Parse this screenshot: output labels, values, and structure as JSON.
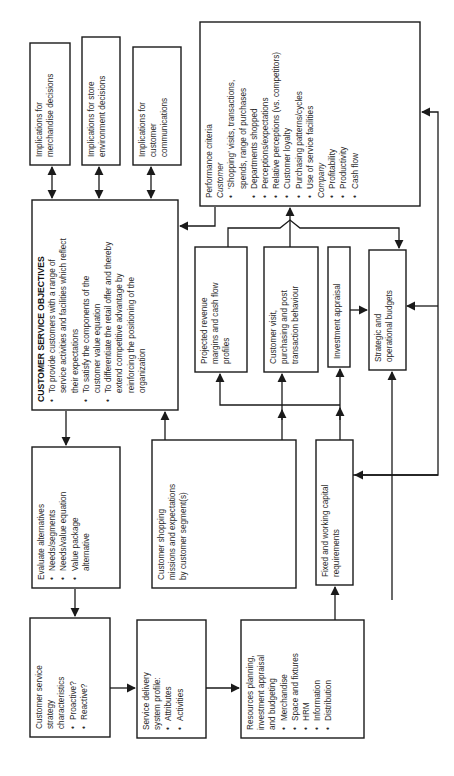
{
  "diagram": {
    "implications": [
      {
        "lines": [
          "Implications for",
          "merchandise decisions"
        ]
      },
      {
        "lines": [
          "Implications for store",
          "environment decisions"
        ]
      },
      {
        "lines": [
          "Implications for",
          "customer",
          "communications"
        ]
      }
    ],
    "objectives": {
      "title": "CUSTOMER SERVICE OBJECTIVES",
      "bullets": [
        [
          "To provide customers with a range of",
          "service activities and facilities which reflect",
          "their expectations"
        ],
        [
          "To satisfy the components of the",
          "customer value equation"
        ],
        [
          "To differentiate the retail offer and thereby",
          "extend competitive advantage by",
          "reinforcing the positioning of the",
          "organization"
        ]
      ]
    },
    "performance": {
      "title": "Performance criteria",
      "customer_heading": "Customer",
      "customer_items": [
        [
          "'Shopping' visits, transactions,",
          "spends, range of purchases"
        ],
        [
          "Departments shopped"
        ],
        [
          "Perceptions/expectations"
        ],
        [
          "Relative perceptions (vs. competitors)"
        ],
        [
          "Customer loyalty"
        ],
        [
          "Purchasing patterns/cycles"
        ],
        [
          "Use of service facilities"
        ]
      ],
      "company_heading": "Company",
      "company_items": [
        "Profitability",
        "Productivity",
        "Cash flow"
      ]
    },
    "projected": {
      "lines": [
        "Projected revenue",
        "margins and cash flow",
        "profiles"
      ]
    },
    "visit": {
      "lines": [
        "Customer visit,",
        "purchasing and post",
        "transaction behaviour"
      ]
    },
    "appraisal": {
      "lines": [
        "Investment appraisal"
      ]
    },
    "budgets": {
      "lines": [
        "Strategic and",
        "operational budgets"
      ]
    },
    "evaluate": {
      "title": "Evaluate alternatives",
      "bullets": [
        [
          "Needs/segments"
        ],
        [
          "Needs/value equation"
        ],
        [
          "Value package",
          "alternative"
        ]
      ]
    },
    "shopping": {
      "lines": [
        "Customer shopping",
        "missions and expectations",
        "by customer segment(s)"
      ]
    },
    "capital": {
      "lines": [
        "Fixed and working capital",
        "requirements"
      ]
    },
    "strategy": {
      "lines": [
        "Customer service",
        "strategy",
        "characteristics"
      ],
      "bullets": [
        "Proactive?",
        "Reactive?"
      ]
    },
    "delivery": {
      "lines": [
        "Service delivery",
        "system profile:"
      ],
      "bullets": [
        "Attributes",
        "Activities"
      ]
    },
    "resources": {
      "lines": [
        "Resources planning,",
        "investment appraisal",
        "and budgeting"
      ],
      "bullets": [
        "Merchandise",
        "Space and fixtures",
        "HRM",
        "Information",
        "Distribution"
      ]
    },
    "bullet_glyph": "•"
  }
}
